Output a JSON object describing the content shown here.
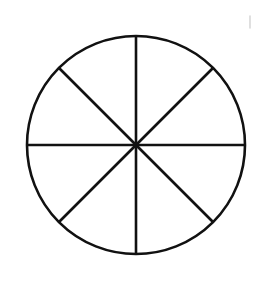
{
  "page": {
    "background_color": "#ffffff",
    "width": 260,
    "height": 281
  },
  "figure": {
    "name": "circle-eighths-diagram",
    "stroke_color": "#111111",
    "fill_color": "none",
    "stroke_width": 2.6,
    "circle": {
      "center_x": 136,
      "center_y": 145,
      "radius": 109
    },
    "sector_count": 8,
    "sector_angle_degrees": 45,
    "diameters": [
      {
        "label": "vertical-diameter",
        "angle_degrees": 90,
        "x1": 136,
        "y1": 36,
        "x2": 136,
        "y2": 254
      },
      {
        "label": "horizontal-diameter",
        "angle_degrees": 0,
        "x1": 27,
        "y1": 145,
        "x2": 245,
        "y2": 145
      },
      {
        "label": "diagonal-diameter-ne-sw",
        "angle_degrees": 45,
        "x1": 213,
        "y1": 68,
        "x2": 59,
        "y2": 222
      },
      {
        "label": "diagonal-diameter-nw-se",
        "angle_degrees": 135,
        "x1": 59,
        "y1": 68,
        "x2": 213,
        "y2": 222
      }
    ],
    "stray_mark": {
      "label": "faint-tick-mark",
      "color": "#d8d8d8",
      "stroke_width": 1.6,
      "x1": 250,
      "y1": 16,
      "x2": 250,
      "y2": 28
    }
  }
}
